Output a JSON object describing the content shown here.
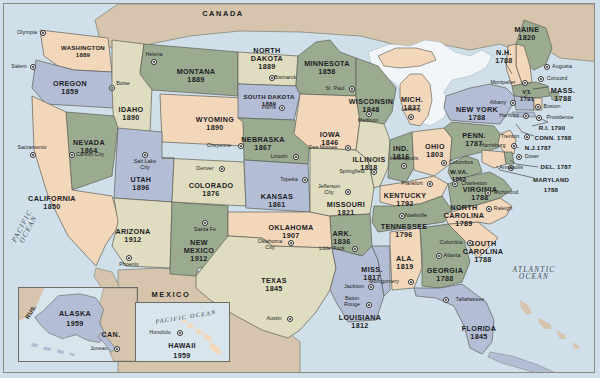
{
  "map": {
    "title": "United States — Statehood Dates",
    "countries": [
      {
        "name": "CANADA",
        "x": 223,
        "y": 14
      },
      {
        "name": "MEXICO",
        "x": 171,
        "y": 295
      }
    ],
    "oceans": [
      {
        "name": "PACIFIC\nOCEAN",
        "x": 26,
        "y": 228,
        "rot": -62
      },
      {
        "name": "ATLANTIC\nOCEAN",
        "x": 534,
        "y": 274,
        "rot": 0
      },
      {
        "name": "PACIFIC OCEAN",
        "x": 179,
        "y": 314,
        "rot": -9
      }
    ],
    "inset_labels": [
      {
        "name": "RUS.",
        "x": 30,
        "y": 294,
        "rot": -58
      },
      {
        "name": "CAN.",
        "x": 110,
        "y": 317
      }
    ],
    "states": [
      {
        "code": "WA",
        "name": "WASHINGTON",
        "year": "1889",
        "x": 83,
        "y": 48,
        "size": "sm"
      },
      {
        "code": "OR",
        "name": "OREGON",
        "year": "1859",
        "x": 70,
        "y": 84,
        "size": "st"
      },
      {
        "code": "ID",
        "name": "IDAHO",
        "year": "1890",
        "x": 131,
        "y": 110,
        "size": "st"
      },
      {
        "code": "MT",
        "name": "MONTANA",
        "year": "1889",
        "x": 196,
        "y": 72,
        "size": "st"
      },
      {
        "code": "WY",
        "name": "WYOMING",
        "year": "1890",
        "x": 215,
        "y": 120,
        "size": "st"
      },
      {
        "code": "NV",
        "name": "NEVADA",
        "year": "1864",
        "x": 89,
        "y": 143,
        "size": "st"
      },
      {
        "code": "UT",
        "name": "UTAH",
        "year": "1896",
        "x": 141,
        "y": 180,
        "size": "st"
      },
      {
        "code": "CA",
        "name": "CALIFORNIA",
        "year": "1850",
        "x": 52,
        "y": 199,
        "size": "st"
      },
      {
        "code": "AZ",
        "name": "ARIZONA",
        "year": "1912",
        "x": 133,
        "y": 232,
        "size": "st"
      },
      {
        "code": "NM",
        "name": "NEW\nMEXICO",
        "year": "1912",
        "x": 199,
        "y": 247,
        "size": "st"
      },
      {
        "code": "CO",
        "name": "COLORADO",
        "year": "1876",
        "x": 211,
        "y": 186,
        "size": "st"
      },
      {
        "code": "ND",
        "name": "NORTH\nDAKOTA",
        "year": "1889",
        "x": 267,
        "y": 55,
        "size": "st"
      },
      {
        "code": "SD",
        "name": "SOUTH DAKOTA",
        "year": "1889",
        "x": 269,
        "y": 97,
        "size": "sm"
      },
      {
        "code": "NE",
        "name": "NEBRASKA",
        "year": "1867",
        "x": 263,
        "y": 140,
        "size": "st"
      },
      {
        "code": "KS",
        "name": "KANSAS",
        "year": "1861",
        "x": 277,
        "y": 197,
        "size": "st"
      },
      {
        "code": "OK",
        "name": "OKLAHOMA",
        "year": "1907",
        "x": 291,
        "y": 228,
        "size": "st"
      },
      {
        "code": "TX",
        "name": "TEXAS",
        "year": "1845",
        "x": 274,
        "y": 281,
        "size": "st"
      },
      {
        "code": "MN",
        "name": "MINNESOTA",
        "year": "1858",
        "x": 327,
        "y": 64,
        "size": "st"
      },
      {
        "code": "IA",
        "name": "IOWA",
        "year": "1846",
        "x": 330,
        "y": 135,
        "size": "st"
      },
      {
        "code": "MO",
        "name": "MISSOURI",
        "year": "1821",
        "x": 346,
        "y": 205,
        "size": "st"
      },
      {
        "code": "AR",
        "name": "ARK.",
        "year": "1836",
        "x": 342,
        "y": 234,
        "size": "st"
      },
      {
        "code": "LA",
        "name": "LOUISIANA",
        "year": "1812",
        "x": 360,
        "y": 318,
        "size": "st"
      },
      {
        "code": "WI",
        "name": "WISCONSIN",
        "year": "1848",
        "x": 371,
        "y": 102,
        "size": "st"
      },
      {
        "code": "IL",
        "name": "ILLINOIS",
        "year": "1818",
        "x": 369,
        "y": 160,
        "size": "st"
      },
      {
        "code": "MS",
        "name": "MISS.",
        "year": "1817",
        "x": 372,
        "y": 270,
        "size": "st"
      },
      {
        "code": "MI",
        "name": "MICH.",
        "year": "1837",
        "x": 412,
        "y": 100,
        "size": "st"
      },
      {
        "code": "IN",
        "name": "IND.",
        "year": "1816",
        "x": 401,
        "y": 149,
        "size": "st"
      },
      {
        "code": "OH",
        "name": "OHIO",
        "year": "1803",
        "x": 435,
        "y": 147,
        "size": "st"
      },
      {
        "code": "KY",
        "name": "KENTUCKY",
        "year": "1792",
        "x": 405,
        "y": 196,
        "size": "st"
      },
      {
        "code": "TN",
        "name": "TENNESSEE",
        "year": "1796",
        "x": 404,
        "y": 227,
        "size": "st"
      },
      {
        "code": "AL",
        "name": "ALA.",
        "year": "1819",
        "x": 405,
        "y": 259,
        "size": "st"
      },
      {
        "code": "GA",
        "name": "GEORGIA",
        "year": "1788",
        "x": 445,
        "y": 271,
        "size": "st"
      },
      {
        "code": "FL",
        "name": "FLORIDA",
        "year": "1845",
        "x": 479,
        "y": 329,
        "size": "st"
      },
      {
        "code": "SC",
        "name": "SOUTH\nCAROLINA",
        "year": "1788",
        "x": 483,
        "y": 248,
        "size": "st"
      },
      {
        "code": "NC",
        "name": "NORTH\nCAROLINA",
        "year": "1789",
        "x": 464,
        "y": 212,
        "size": "st"
      },
      {
        "code": "VA",
        "name": "VIRGINIA",
        "year": "1788",
        "x": 480,
        "y": 190,
        "size": "st"
      },
      {
        "code": "WV",
        "name": "W.VA.",
        "year": "1863",
        "x": 459,
        "y": 172,
        "size": "sm"
      },
      {
        "code": "PA",
        "name": "PENN.",
        "year": "1787",
        "x": 474,
        "y": 136,
        "size": "st"
      },
      {
        "code": "NY",
        "name": "NEW YORK",
        "year": "1788",
        "x": 477,
        "y": 110,
        "size": "st"
      },
      {
        "code": "ME",
        "name": "MAINE",
        "year": "1820",
        "x": 527,
        "y": 30,
        "size": "st"
      },
      {
        "code": "NH",
        "name": "N.H.",
        "year": "1788",
        "x": 504,
        "y": 53,
        "size": "st"
      },
      {
        "code": "VT",
        "name": "VT.",
        "year": "1791",
        "x": 527,
        "y": 92,
        "size": "sm"
      },
      {
        "code": "MA",
        "name": "MASS.",
        "year": "1788",
        "x": 563,
        "y": 91,
        "size": "st"
      }
    ],
    "flat_labels": [
      {
        "name": "R.I. 1790",
        "x": 552,
        "y": 128,
        "size": "sm"
      },
      {
        "name": "CONN. 1788",
        "x": 553,
        "y": 138,
        "size": "sm"
      },
      {
        "name": "N.J.1787",
        "x": 538,
        "y": 148,
        "size": "sm"
      },
      {
        "name": "DEL. 1787",
        "x": 556,
        "y": 167,
        "size": "sm"
      },
      {
        "name": "MARYLAND",
        "x": 551,
        "y": 180,
        "size": "sm"
      },
      {
        "name": "1788",
        "x": 551,
        "y": 190,
        "size": "sm"
      }
    ],
    "cities": [
      {
        "name": "Olympia",
        "x": 43,
        "y": 33,
        "dx": -16,
        "dy": 0
      },
      {
        "name": "Salem",
        "x": 33,
        "y": 67,
        "dx": -14,
        "dy": 0
      },
      {
        "name": "Sacramento",
        "x": 33,
        "y": 155,
        "dx": -1,
        "dy": -7
      },
      {
        "name": "Carson City",
        "x": 72,
        "y": 155,
        "dx": 18,
        "dy": 0
      },
      {
        "name": "Helena",
        "x": 154,
        "y": 62,
        "dx": 0,
        "dy": -7
      },
      {
        "name": "Boise",
        "x": 112,
        "y": 88,
        "dx": 11,
        "dy": -4
      },
      {
        "name": "Salt Lake\nCity",
        "x": 145,
        "y": 155,
        "dx": 0,
        "dy": 10
      },
      {
        "name": "Phoenix",
        "x": 129,
        "y": 258,
        "dx": 0,
        "dy": 7
      },
      {
        "name": "Santa Fe",
        "x": 205,
        "y": 223,
        "dx": 0,
        "dy": 7
      },
      {
        "name": "Denver",
        "x": 222,
        "y": 169,
        "dx": -17,
        "dy": 0
      },
      {
        "name": "Cheyenne",
        "x": 241,
        "y": 146,
        "dx": -22,
        "dy": 0
      },
      {
        "name": "Bismarck",
        "x": 272,
        "y": 78,
        "dx": 13,
        "dy": 0
      },
      {
        "name": "Pierre",
        "x": 282,
        "y": 108,
        "dx": -13,
        "dy": 0
      },
      {
        "name": "Lincoln",
        "x": 296,
        "y": 157,
        "dx": -17,
        "dy": 0
      },
      {
        "name": "Topeka",
        "x": 305,
        "y": 180,
        "dx": -16,
        "dy": 0
      },
      {
        "name": "Oklahoma\nCity",
        "x": 291,
        "y": 243,
        "dx": -21,
        "dy": 2
      },
      {
        "name": "Austin",
        "x": 290,
        "y": 319,
        "dx": -16,
        "dy": 0
      },
      {
        "name": "St. Paul",
        "x": 352,
        "y": 89,
        "dx": -17,
        "dy": 0
      },
      {
        "name": "Des Moines",
        "x": 348,
        "y": 148,
        "dx": -25,
        "dy": 0
      },
      {
        "name": "Madison",
        "x": 369,
        "y": 114,
        "dx": -1,
        "dy": 7
      },
      {
        "name": "Springfield",
        "x": 374,
        "y": 172,
        "dx": -22,
        "dy": 0
      },
      {
        "name": "Jefferson\nCity",
        "x": 348,
        "y": 192,
        "dx": -19,
        "dy": -2
      },
      {
        "name": "Little Rock",
        "x": 355,
        "y": 249,
        "dx": -23,
        "dy": 0
      },
      {
        "name": "Jackson",
        "x": 371,
        "y": 287,
        "dx": -17,
        "dy": 0
      },
      {
        "name": "Baton\nRouge",
        "x": 369,
        "y": 305,
        "dx": -17,
        "dy": -3
      },
      {
        "name": "Montgomery",
        "x": 411,
        "y": 282,
        "dx": -27,
        "dy": 0
      },
      {
        "name": "Nashville",
        "x": 402,
        "y": 216,
        "dx": 14,
        "dy": 0
      },
      {
        "name": "Lansing",
        "x": 411,
        "y": 117,
        "dx": 0,
        "dy": -7
      },
      {
        "name": "Indianapolis",
        "x": 404,
        "y": 166,
        "dx": 0,
        "dy": -7
      },
      {
        "name": "Columbus",
        "x": 444,
        "y": 163,
        "dx": 17,
        "dy": 0
      },
      {
        "name": "Frankfort",
        "x": 430,
        "y": 184,
        "dx": -18,
        "dy": 0
      },
      {
        "name": "Charleston",
        "x": 455,
        "y": 184,
        "dx": 19,
        "dy": 0
      },
      {
        "name": "Richmond",
        "x": 488,
        "y": 193,
        "dx": 18,
        "dy": 0
      },
      {
        "name": "Raleigh",
        "x": 489,
        "y": 209,
        "dx": 14,
        "dy": 0
      },
      {
        "name": "Columbia",
        "x": 470,
        "y": 243,
        "dx": -19,
        "dy": 0
      },
      {
        "name": "Atlanta",
        "x": 439,
        "y": 256,
        "dx": 13,
        "dy": 0
      },
      {
        "name": "Tallahassee",
        "x": 446,
        "y": 300,
        "dx": 24,
        "dy": 0
      },
      {
        "name": "Harrisburg",
        "x": 514,
        "y": 146,
        "dx": -21,
        "dy": 0
      },
      {
        "name": "Trenton",
        "x": 527,
        "y": 137,
        "dx": -17,
        "dy": 0
      },
      {
        "name": "Dover",
        "x": 519,
        "y": 157,
        "dx": 13,
        "dy": 0
      },
      {
        "name": "Annapolis",
        "x": 511,
        "y": 168,
        "dx": 0,
        "dy": 0
      },
      {
        "name": "Albany",
        "x": 513,
        "y": 103,
        "dx": -15,
        "dy": 0
      },
      {
        "name": "Hartford",
        "x": 526,
        "y": 116,
        "dx": -17,
        "dy": 0
      },
      {
        "name": "Providence",
        "x": 539,
        "y": 118,
        "dx": 21,
        "dy": 0
      },
      {
        "name": "Boston",
        "x": 538,
        "y": 107,
        "dx": 14,
        "dy": 0
      },
      {
        "name": "Concord",
        "x": 541,
        "y": 79,
        "dx": 16,
        "dy": 0
      },
      {
        "name": "Augusta",
        "x": 547,
        "y": 67,
        "dx": 15,
        "dy": 0
      },
      {
        "name": "Montpelier",
        "x": 525,
        "y": 83,
        "dx": -22,
        "dy": 0
      }
    ],
    "inset_alaska": {
      "label": "ALASKA",
      "year": "1959",
      "city": "Juneau",
      "x": 18,
      "y": 287,
      "w": 120,
      "h": 75
    },
    "inset_hawaii": {
      "label": "HAWAII",
      "year": "1959",
      "city": "Honolulu",
      "x": 135,
      "y": 302,
      "w": 95,
      "h": 60
    },
    "colors": {
      "ocean": "#cfe0ea",
      "canada": "#d6c5ac",
      "mexico": "#d6c5ac",
      "green": "#9aab90",
      "peach": "#f3d7bb",
      "blue": "#b3bed6",
      "cream": "#dfdcc0",
      "lakes": "#f2f6f8",
      "border": "#6a6a62",
      "text": "#1c1c22"
    }
  }
}
